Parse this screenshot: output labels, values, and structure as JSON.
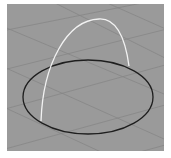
{
  "viewport": {
    "label": "3D perspective viewport",
    "background_color": "#9a9a9a",
    "grid_color": "#858585",
    "objects": [
      {
        "name": "circle-curve",
        "type": "ellipse",
        "stroke": "#1e1e1e",
        "cx": 81,
        "cy": 93,
        "rx": 65,
        "ry": 37
      },
      {
        "name": "arc-curve",
        "type": "arc",
        "stroke": "#f2f2f2",
        "start": [
          34,
          117
        ],
        "apex": [
          93,
          15
        ],
        "end": [
          122,
          62
        ]
      }
    ]
  }
}
